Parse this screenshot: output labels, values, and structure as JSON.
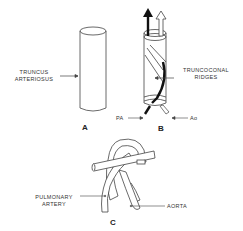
{
  "panels": {
    "a": {
      "letter": "A",
      "labels": {
        "truncus_line1": "TRUNCUS",
        "truncus_line2": "ARTERIOSUS"
      }
    },
    "b": {
      "letter": "B",
      "labels": {
        "ridges_line1": "TRUNCOCONAL",
        "ridges_line2": "RIDGES",
        "pa": "PA",
        "ao": "Ao"
      }
    },
    "c": {
      "letter": "C",
      "labels": {
        "pulmonary_line1": "PULMONARY",
        "pulmonary_line2": "ARTERY",
        "aorta": "AORTA"
      }
    }
  },
  "colors": {
    "line": "#333333",
    "dark": "#111111",
    "background": "#ffffff"
  }
}
